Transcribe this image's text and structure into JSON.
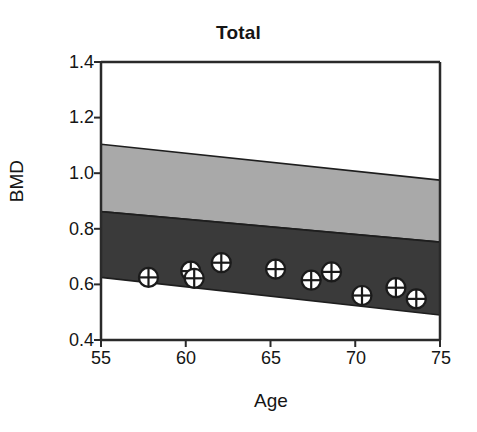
{
  "chart_data": {
    "type": "scatter",
    "title": "Total",
    "xlabel": "Age",
    "ylabel": "BMD",
    "xlim": [
      55,
      75
    ],
    "ylim": [
      0.4,
      1.4
    ],
    "xticks": [
      55,
      60,
      65,
      70,
      75
    ],
    "yticks": [
      "0.4",
      "0.6",
      "0.8",
      "1.0",
      "1.2",
      "1.4"
    ],
    "grid": false,
    "legend": "none",
    "points": [
      {
        "x": 57.8,
        "y": 0.625
      },
      {
        "x": 60.3,
        "y": 0.648
      },
      {
        "x": 60.5,
        "y": 0.622
      },
      {
        "x": 62.1,
        "y": 0.678
      },
      {
        "x": 65.3,
        "y": 0.655
      },
      {
        "x": 67.4,
        "y": 0.615
      },
      {
        "x": 68.6,
        "y": 0.645
      },
      {
        "x": 70.4,
        "y": 0.56
      },
      {
        "x": 72.4,
        "y": 0.588
      },
      {
        "x": 73.6,
        "y": 0.548
      }
    ],
    "bands": [
      {
        "name": "light-band",
        "color": "#a9a9a9",
        "upper": {
          "x55": 1.104,
          "x75": 0.975
        },
        "lower": {
          "x55": 0.862,
          "x75": 0.752
        }
      },
      {
        "name": "dark-band",
        "color": "#3a3a3a",
        "upper": {
          "x55": 0.862,
          "x75": 0.752
        },
        "lower": {
          "x55": 0.625,
          "x75": 0.49
        }
      }
    ],
    "marker": {
      "shape": "circle-with-cross",
      "fill": "#ffffff",
      "stroke": "#1b1b1b"
    }
  },
  "colors": {
    "axis": "#2a2a2a",
    "band_light": "#a9a9a9",
    "band_dark": "#3a3a3a",
    "background": "#ffffff",
    "text": "#151515"
  }
}
